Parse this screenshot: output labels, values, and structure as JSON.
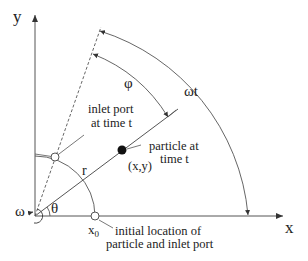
{
  "diagram": {
    "axes": {
      "x_label": "x",
      "y_label": "y"
    },
    "angles": {
      "theta": "θ",
      "phi": "φ",
      "omega_t": "ωt",
      "omega": "ω"
    },
    "radius_label": "r",
    "x0_label": "x",
    "x0_subscript": "0",
    "particle": {
      "label_line1": "particle at",
      "label_line2": "time t",
      "coords": "(x,y)"
    },
    "inlet": {
      "label_line1": "inlet port",
      "label_line2": "at time t"
    },
    "initial": {
      "label_line1": "initial location of",
      "label_line2": "particle and inlet port"
    },
    "colors": {
      "line": "#555555",
      "text": "#222222",
      "particle": "#111111"
    }
  }
}
